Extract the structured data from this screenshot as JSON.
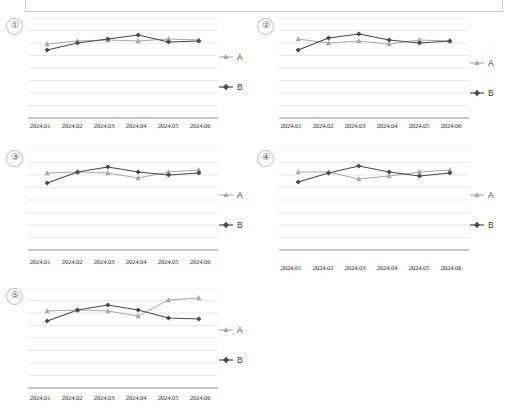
{
  "page": {
    "top_box": "",
    "background_color": "#ffffff"
  },
  "series_style": {
    "A_color": "#a8a8a8",
    "B_color": "#4a4a4a",
    "grid_color": "#e3e3e3",
    "axis_color": "#9a9a9a"
  },
  "legend": {
    "a_label": "A",
    "b_label": "B",
    "a_icon": "triangle-marker-icon",
    "b_icon": "diamond-marker-icon"
  },
  "panels": [
    {
      "index": "①"
    },
    {
      "index": "②"
    },
    {
      "index": "③"
    },
    {
      "index": "④"
    },
    {
      "index": "⑤"
    }
  ],
  "chart_data": [
    {
      "type": "line",
      "title": "①",
      "xlabel": "",
      "ylabel": "",
      "x": [
        "2024.01",
        "2024.02",
        "2024.03",
        "2024.04",
        "2024.05",
        "2024.06"
      ],
      "ylim": [
        0,
        100
      ],
      "grid": true,
      "legend_position": "right",
      "series": [
        {
          "name": "A",
          "values": [
            74,
            77,
            78,
            77,
            79,
            78
          ]
        },
        {
          "name": "B",
          "values": [
            68,
            75,
            79,
            83,
            76,
            77
          ]
        }
      ]
    },
    {
      "type": "line",
      "title": "②",
      "xlabel": "",
      "ylabel": "",
      "x": [
        "2024.01",
        "2024.02",
        "2024.03",
        "2024.04",
        "2024.05",
        "2024.06"
      ],
      "ylim": [
        0,
        100
      ],
      "grid": true,
      "legend_position": "right",
      "series": [
        {
          "name": "A",
          "values": [
            79,
            75,
            77,
            74,
            78,
            77
          ]
        },
        {
          "name": "B",
          "values": [
            68,
            80,
            84,
            78,
            75,
            77
          ]
        }
      ]
    },
    {
      "type": "line",
      "title": "③",
      "xlabel": "",
      "ylabel": "",
      "x": [
        "2024.01",
        "2024.02",
        "2024.03",
        "2024.04",
        "2024.05",
        "2024.06"
      ],
      "ylim": [
        0,
        100
      ],
      "grid": true,
      "legend_position": "right",
      "series": [
        {
          "name": "A",
          "values": [
            77,
            78,
            77,
            72,
            78,
            80
          ]
        },
        {
          "name": "B",
          "values": [
            67,
            78,
            83,
            78,
            75,
            77
          ]
        }
      ]
    },
    {
      "type": "line",
      "title": "④",
      "xlabel": "",
      "ylabel": "",
      "x": [
        "2024.01",
        "2024.02",
        "2024.03",
        "2024.04",
        "2024.05",
        "2024.06"
      ],
      "ylim": [
        0,
        100
      ],
      "grid": true,
      "legend_position": "right",
      "series": [
        {
          "name": "A",
          "values": [
            78,
            78,
            71,
            74,
            78,
            80
          ]
        },
        {
          "name": "B",
          "values": [
            68,
            77,
            84,
            78,
            74,
            77
          ]
        }
      ]
    },
    {
      "type": "line",
      "title": "⑤",
      "xlabel": "",
      "ylabel": "",
      "x": [
        "2024.01",
        "2024.02",
        "2024.03",
        "2024.04",
        "2024.05",
        "2024.06"
      ],
      "ylim": [
        0,
        100
      ],
      "grid": true,
      "legend_position": "right",
      "series": [
        {
          "name": "A",
          "values": [
            77,
            78,
            77,
            72,
            88,
            90
          ]
        },
        {
          "name": "B",
          "values": [
            67,
            78,
            83,
            78,
            70,
            69
          ]
        }
      ]
    }
  ]
}
